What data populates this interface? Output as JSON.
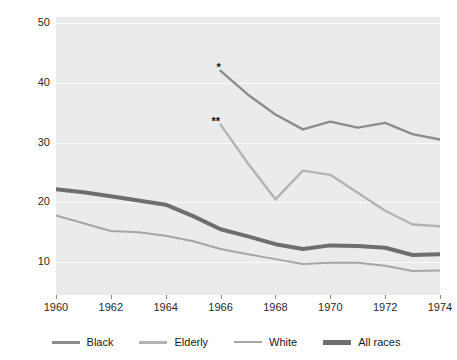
{
  "chart_data": {
    "type": "line",
    "title": "",
    "xlabel": "",
    "ylabel": "Percent of group living below poverty line",
    "xlim": [
      1960,
      1974
    ],
    "ylim": [
      4.5,
      51.0
    ],
    "yticks": [
      10,
      20,
      30,
      40,
      50
    ],
    "xticks": [
      1960,
      1962,
      1964,
      1966,
      1968,
      1970,
      1972,
      1974
    ],
    "grid": true,
    "legend_position": "bottom",
    "annotations": [
      {
        "text": "*",
        "x": 1966,
        "y": 42.0
      },
      {
        "text": "**",
        "x": 1966,
        "y": 33.0
      }
    ],
    "series": [
      {
        "name": "Black",
        "color": "#8c8c8c",
        "width": 2.4,
        "x": [
          1966,
          1967,
          1968,
          1969,
          1970,
          1971,
          1972,
          1973,
          1974
        ],
        "values": [
          42.0,
          38.0,
          34.7,
          32.2,
          33.5,
          32.5,
          33.3,
          31.4,
          30.5
        ]
      },
      {
        "name": "Elderly",
        "color": "#b3b3b3",
        "width": 2.4,
        "x": [
          1966,
          1967,
          1968,
          1969,
          1970,
          1971,
          1972,
          1973,
          1974
        ],
        "values": [
          33.0,
          26.5,
          20.5,
          25.3,
          24.6,
          21.6,
          18.6,
          16.3,
          16.0
        ]
      },
      {
        "name": "White",
        "color": "#a6a6a6",
        "width": 2.0,
        "x": [
          1960,
          1961,
          1962,
          1963,
          1964,
          1965,
          1966,
          1967,
          1968,
          1969,
          1970,
          1971,
          1972,
          1973,
          1974
        ],
        "values": [
          17.8,
          16.5,
          15.2,
          15.0,
          14.4,
          13.5,
          12.2,
          11.3,
          10.5,
          9.7,
          9.9,
          9.9,
          9.4,
          8.5,
          8.6
        ]
      },
      {
        "name": "All races",
        "color": "#6e6e6e",
        "width": 4.0,
        "x": [
          1960,
          1961,
          1962,
          1963,
          1964,
          1965,
          1966,
          1967,
          1968,
          1969,
          1970,
          1971,
          1972,
          1973,
          1974
        ],
        "values": [
          22.2,
          21.7,
          21.0,
          20.3,
          19.6,
          17.7,
          15.5,
          14.3,
          13.0,
          12.2,
          12.8,
          12.7,
          12.4,
          11.2,
          11.3
        ]
      }
    ]
  },
  "axis": {
    "y_title": "Percent of group living below poverty line",
    "y_tick_labels": [
      "50",
      "40",
      "30",
      "20",
      "10"
    ],
    "x_tick_labels": [
      "1960",
      "1962",
      "1964",
      "1966",
      "1968",
      "1970",
      "1972",
      "1974"
    ]
  },
  "legend": {
    "items": [
      {
        "label": "Black",
        "color": "#8c8c8c",
        "thickness": "3px"
      },
      {
        "label": "Elderly",
        "color": "#b3b3b3",
        "thickness": "3px"
      },
      {
        "label": "White",
        "color": "#a6a6a6",
        "thickness": "2px"
      },
      {
        "label": "All races",
        "color": "#6e6e6e",
        "thickness": "5px"
      }
    ]
  },
  "annotations": {
    "marker_one": "*",
    "marker_two": "**"
  },
  "colors": {
    "plot_background": "#ebebeb",
    "gridline": "#fafafa",
    "page_background": "#ffffff",
    "text": "#1a1a1a"
  }
}
